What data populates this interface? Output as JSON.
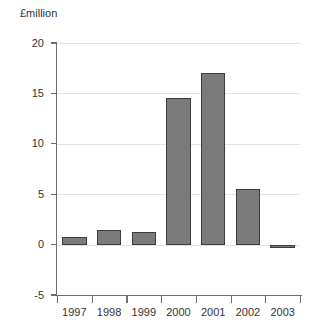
{
  "chart_data": {
    "type": "bar",
    "title": "",
    "subtitle": "",
    "xlabel": "",
    "ylabel": "£million",
    "categories": [
      "1997",
      "1998",
      "1999",
      "2000",
      "2001",
      "2002",
      "2003"
    ],
    "values": [
      0.8,
      1.4,
      1.3,
      14.5,
      17.0,
      5.5,
      -0.2
    ],
    "series": [
      {
        "name": "£million",
        "values": [
          0.8,
          1.4,
          1.3,
          14.5,
          17.0,
          5.5,
          -0.2
        ]
      }
    ],
    "ylim": [
      -5,
      20
    ],
    "xlim": [
      0,
      7
    ],
    "ytick_labels": [
      "20",
      "15",
      "10",
      "5",
      "0",
      "-5"
    ],
    "ytick_values": [
      20,
      15,
      10,
      5,
      0,
      -5
    ],
    "grid": true,
    "gridlines_at": [
      20,
      15,
      10,
      5,
      0
    ],
    "legend": false,
    "legend_position": "none",
    "bar_fill_color": "#7a7a7a",
    "bar_border_color": "#3c3c3c",
    "gridline_color": "#e2e2e2",
    "axis_color": "#6e6e6e",
    "background_color": "#ffffff"
  },
  "axis_title": {
    "text": "£million"
  }
}
